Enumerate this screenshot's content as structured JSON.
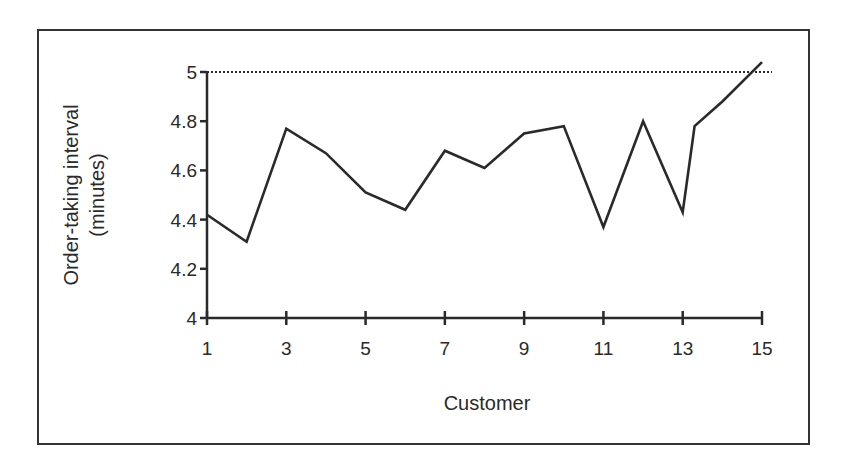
{
  "chart_data": {
    "type": "line",
    "title": "",
    "xlabel": "Customer",
    "ylabel": [
      "Order-taking interval",
      "(minutes)"
    ],
    "xlim": [
      1,
      15
    ],
    "ylim": [
      4,
      5
    ],
    "x_ticks": [
      1,
      3,
      5,
      7,
      9,
      11,
      13,
      15
    ],
    "x_tick_labels": [
      "1",
      "3",
      "5",
      "7",
      "9",
      "11",
      "13",
      "15"
    ],
    "y_ticks": [
      4,
      4.2,
      4.4,
      4.6,
      4.8,
      5
    ],
    "y_tick_labels": [
      "4",
      "4.2",
      "4.4",
      "4.6",
      "4.8",
      "5"
    ],
    "grid": false,
    "legend": null,
    "reference_line": {
      "y": 5,
      "style": "dotted",
      "label": ""
    },
    "series": [
      {
        "name": "Order-taking interval",
        "color": "#2a2a2a",
        "x": [
          1,
          2,
          3,
          4,
          5,
          6,
          7,
          8,
          9,
          10,
          11,
          12,
          13,
          13.3,
          14,
          15
        ],
        "values": [
          4.42,
          4.31,
          4.77,
          4.67,
          4.51,
          4.44,
          4.68,
          4.61,
          4.75,
          4.78,
          4.37,
          4.8,
          4.43,
          4.78,
          4.88,
          5.04
        ]
      }
    ]
  },
  "labels": {
    "x_axis_title": "Customer",
    "y_axis_title_line1": "Order-taking interval",
    "y_axis_title_line2": "(minutes)"
  }
}
